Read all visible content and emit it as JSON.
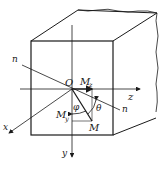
{
  "diagram": {
    "type": "isometric beam cross-section with bending moment decomposition",
    "labels": {
      "origin": "O",
      "neutral_axis_start": "n",
      "neutral_axis_end": "n",
      "axis_x": "x",
      "axis_y": "y",
      "axis_z": "z",
      "moment": "M",
      "moment_y": "M",
      "moment_y_sub": "y",
      "moment_z": "M",
      "moment_z_sub": "z",
      "angle_phi": "φ",
      "angle_theta": "θ"
    },
    "colors": {
      "stroke": "#1a1a1a",
      "background": "#ffffff"
    }
  }
}
